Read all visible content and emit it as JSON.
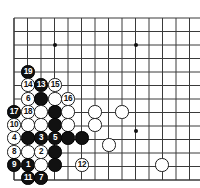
{
  "app": {
    "title": "Go Game Record Diagram",
    "board_color": "#ffffff",
    "line_color": "#3a3a3a",
    "black_color": "#111111",
    "white_color": "#ffffff",
    "black_label_color": "#ffffff",
    "white_label_color": "#111111"
  },
  "board": {
    "origin_x": 14,
    "origin_y": 18,
    "spacing": 13.5,
    "cols": 14,
    "rows": 12,
    "left_edge": true,
    "bottom_edge": true,
    "stone_radius": 6.6,
    "star_points": [
      {
        "name": "star-point-upper-left",
        "x": 55,
        "y": 45
      },
      {
        "name": "star-point-upper-right",
        "x": 136,
        "y": 45
      },
      {
        "name": "star-point-lower-right",
        "x": 136,
        "y": 131
      }
    ]
  },
  "stones": [
    {
      "name": "stone-move-19",
      "color": "black",
      "label": "19",
      "x": 28,
      "y": 72
    },
    {
      "name": "stone-move-14",
      "color": "white",
      "label": "14",
      "x": 28,
      "y": 85
    },
    {
      "name": "stone-move-13",
      "color": "black",
      "label": "13",
      "x": 41,
      "y": 85
    },
    {
      "name": "stone-move-15",
      "color": "white",
      "label": "15",
      "x": 55,
      "y": 85
    },
    {
      "name": "stone-move-6",
      "color": "white",
      "label": "6",
      "x": 28,
      "y": 99
    },
    {
      "name": "stone-black-c3r99",
      "color": "black",
      "label": "",
      "x": 41,
      "y": 99
    },
    {
      "name": "stone-white-c4r99",
      "color": "white",
      "label": "",
      "x": 55,
      "y": 99
    },
    {
      "name": "stone-move-16",
      "color": "white",
      "label": "16",
      "x": 68,
      "y": 99
    },
    {
      "name": "stone-move-17",
      "color": "black",
      "label": "17",
      "x": 14,
      "y": 112
    },
    {
      "name": "stone-move-18",
      "color": "white",
      "label": "18",
      "x": 28,
      "y": 112
    },
    {
      "name": "stone-white-c3r112",
      "color": "white",
      "label": "",
      "x": 41,
      "y": 112
    },
    {
      "name": "stone-black-c4r112",
      "color": "black",
      "label": "",
      "x": 55,
      "y": 112
    },
    {
      "name": "stone-white-c5r112",
      "color": "white",
      "label": "",
      "x": 68,
      "y": 112
    },
    {
      "name": "stone-white-c7r112",
      "color": "white",
      "label": "",
      "x": 95,
      "y": 112
    },
    {
      "name": "stone-white-c9r112",
      "color": "white",
      "label": "",
      "x": 122,
      "y": 112
    },
    {
      "name": "stone-move-10",
      "color": "white",
      "label": "10",
      "x": 14,
      "y": 125
    },
    {
      "name": "stone-white-c2r125",
      "color": "white",
      "label": "",
      "x": 28,
      "y": 125
    },
    {
      "name": "stone-white-c3r125",
      "color": "white",
      "label": "",
      "x": 41,
      "y": 125
    },
    {
      "name": "stone-black-c4r125",
      "color": "black",
      "label": "",
      "x": 55,
      "y": 125
    },
    {
      "name": "stone-white-c5r125",
      "color": "white",
      "label": "",
      "x": 68,
      "y": 125
    },
    {
      "name": "stone-white-c7r125",
      "color": "white",
      "label": "",
      "x": 95,
      "y": 125
    },
    {
      "name": "stone-move-4",
      "color": "white",
      "label": "4",
      "x": 14,
      "y": 138
    },
    {
      "name": "stone-black-c2r138",
      "color": "black",
      "label": "",
      "x": 28,
      "y": 138
    },
    {
      "name": "stone-move-3",
      "color": "black",
      "label": "3",
      "x": 41,
      "y": 138
    },
    {
      "name": "stone-move-5",
      "color": "black",
      "label": "5",
      "x": 55,
      "y": 138
    },
    {
      "name": "stone-black-c5r138",
      "color": "black",
      "label": "",
      "x": 68,
      "y": 138
    },
    {
      "name": "stone-black-c6r138",
      "color": "black",
      "label": "",
      "x": 82,
      "y": 138
    },
    {
      "name": "stone-move-8",
      "color": "white",
      "label": "8",
      "x": 14,
      "y": 152
    },
    {
      "name": "stone-white-c2r152",
      "color": "white",
      "label": "",
      "x": 28,
      "y": 152
    },
    {
      "name": "stone-move-2",
      "color": "white",
      "label": "2",
      "x": 41,
      "y": 152
    },
    {
      "name": "stone-black-c4r152",
      "color": "black",
      "label": "",
      "x": 55,
      "y": 152
    },
    {
      "name": "stone-white-c8r145",
      "color": "white",
      "label": "",
      "x": 109,
      "y": 145
    },
    {
      "name": "stone-move-9",
      "color": "black",
      "label": "9",
      "x": 14,
      "y": 165
    },
    {
      "name": "stone-move-1",
      "color": "black",
      "label": "1",
      "x": 28,
      "y": 165
    },
    {
      "name": "stone-white-c3r165",
      "color": "white",
      "label": "",
      "x": 41,
      "y": 165
    },
    {
      "name": "stone-black-c4r165",
      "color": "black",
      "label": "",
      "x": 55,
      "y": 165
    },
    {
      "name": "stone-move-12",
      "color": "white",
      "label": "12",
      "x": 82,
      "y": 165
    },
    {
      "name": "stone-white-c11r165",
      "color": "white",
      "label": "",
      "x": 162,
      "y": 165
    },
    {
      "name": "stone-move-11",
      "color": "black",
      "label": "11",
      "x": 28,
      "y": 178
    },
    {
      "name": "stone-move-7",
      "color": "black",
      "label": "7",
      "x": 41,
      "y": 178
    }
  ]
}
